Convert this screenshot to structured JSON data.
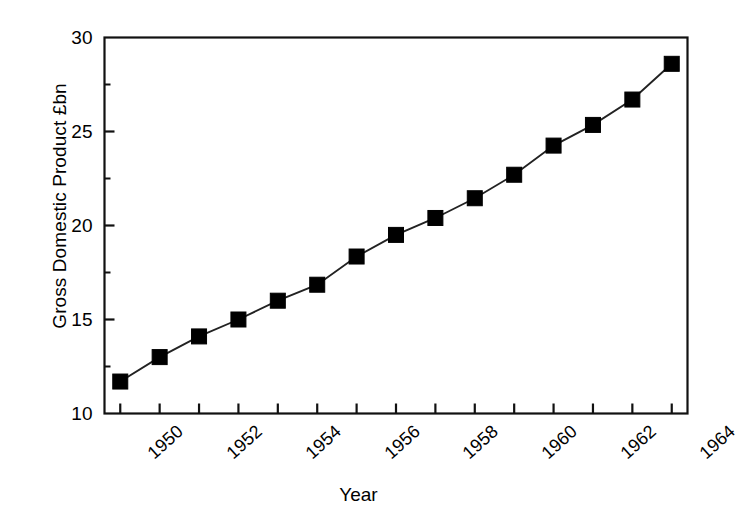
{
  "chart_data": {
    "type": "line",
    "title": "",
    "subtitle": "",
    "xlabel": "Year",
    "ylabel": "Gross Domestic Product £bn",
    "x": [
      1950,
      1951,
      1952,
      1953,
      1954,
      1955,
      1956,
      1957,
      1958,
      1959,
      1960,
      1961,
      1962,
      1963,
      1964
    ],
    "values": [
      11.7,
      13.0,
      14.1,
      15.0,
      16.0,
      16.85,
      18.35,
      19.5,
      20.4,
      21.45,
      22.7,
      24.25,
      25.35,
      26.7,
      28.6
    ],
    "series": [
      {
        "name": "Gross Domestic Product £bn",
        "values": [
          11.7,
          13.0,
          14.1,
          15.0,
          16.0,
          16.85,
          18.35,
          19.5,
          20.4,
          21.45,
          22.7,
          24.25,
          25.35,
          26.7,
          28.6
        ]
      }
    ],
    "xlim": [
      1949.6,
      1964.4
    ],
    "ylim": [
      10,
      30
    ],
    "ytick_labels": [
      "10",
      "15",
      "20",
      "25",
      "30"
    ],
    "yticks": [
      10,
      15,
      20,
      25,
      30
    ],
    "yminor_ticks": [
      12.5,
      17.5,
      22.5,
      27.5
    ],
    "xtick_labels": [
      "1950",
      "1952",
      "1954",
      "1956",
      "1958",
      "1960",
      "1962",
      "1964"
    ],
    "xticks": [
      1950,
      1951,
      1952,
      1953,
      1954,
      1955,
      1956,
      1957,
      1958,
      1959,
      1960,
      1961,
      1962,
      1963,
      1964
    ],
    "xtick_label_rotation": -42,
    "grid": false,
    "legend": false,
    "legend_position": "none",
    "marker": "filled-square",
    "marker_color": "#000000",
    "line_color": "#000000",
    "background_color": "#ffffff",
    "frame": true,
    "annotations": []
  }
}
